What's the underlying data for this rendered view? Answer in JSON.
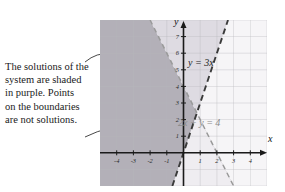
{
  "caption": {
    "lines": [
      "The solutions of the",
      "system are shaded",
      "in purple. Points",
      "on the boundaries",
      "are not solutions."
    ]
  },
  "axes": {
    "x_label": "x",
    "y_label": "y",
    "x_ticks": [
      "-4",
      "-3",
      "-2",
      "-1",
      "1",
      "2",
      "3",
      "4"
    ],
    "y_ticks": [
      "1",
      "2",
      "3",
      "4",
      "5",
      "6",
      "7"
    ]
  },
  "equations": {
    "line1_label": "y = 3x",
    "line2_label": "2x + y = 4"
  },
  "colors": {
    "solution_shade": "#b3b0b8",
    "secondary_shade": "#dedbe2",
    "light_shade": "#efedf1",
    "grid": "#b9b9bd",
    "axis": "#1a1a1a",
    "boundary_dark": "#3a3a3a",
    "boundary_gray": "#9a9a9a",
    "panel_background": "#f6f5f7"
  },
  "chart_data": {
    "type": "line",
    "title": "",
    "xlabel": "x",
    "ylabel": "y",
    "xlim": [
      -5,
      5
    ],
    "ylim": [
      -2,
      8
    ],
    "grid": true,
    "legend": "inline-annotations",
    "series": [
      {
        "name": "y = 3x",
        "style": "dashed",
        "color": "#3a3a3a",
        "slope": 3,
        "intercept": 0,
        "points": [
          [
            -0.7,
            -2.1
          ],
          [
            2.67,
            8.0
          ]
        ]
      },
      {
        "name": "2x + y = 4",
        "style": "dashed",
        "color": "#9a9a9a",
        "slope": -2,
        "intercept": 4,
        "points": [
          [
            -2.0,
            8.0
          ],
          [
            3.0,
            -2.0
          ]
        ]
      }
    ],
    "regions": [
      {
        "name": "solution-region",
        "description": "y < 3x and 2x + y < 4 shaded in purple",
        "fill": "#b3b0b8"
      }
    ],
    "annotations": [
      {
        "text": "The solutions of the system are shaded in purple. Points on the boundaries are not solutions.",
        "arrows": 2
      }
    ]
  }
}
